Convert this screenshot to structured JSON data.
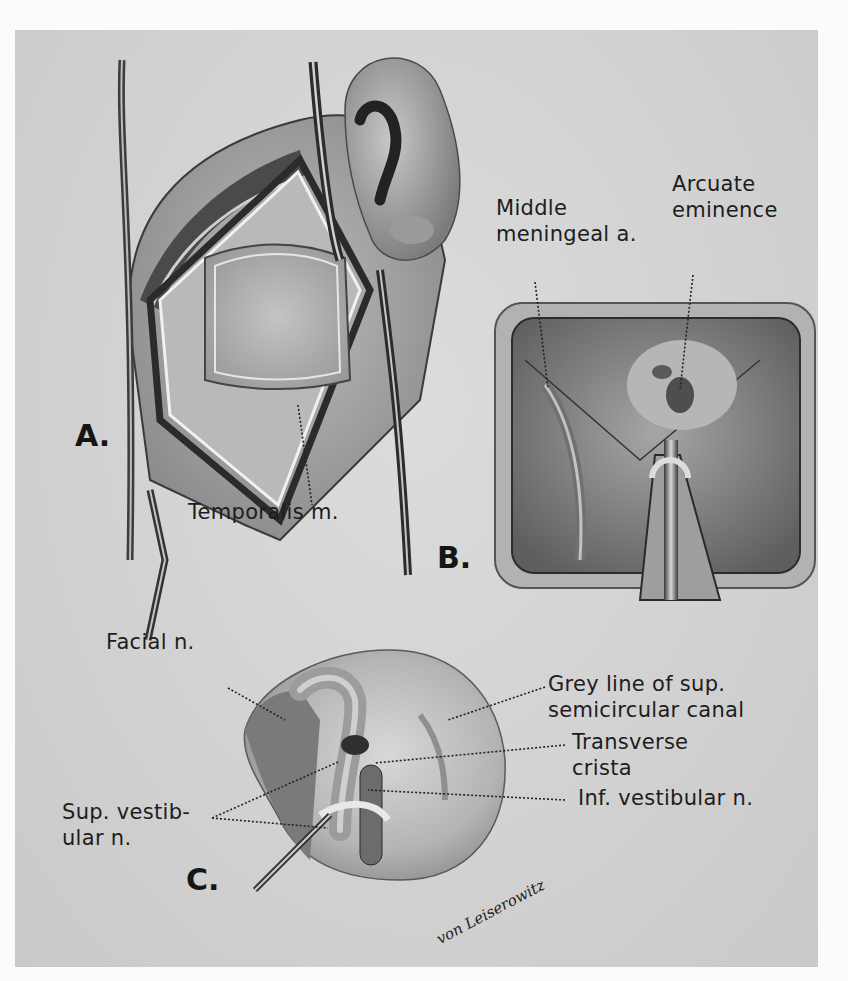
{
  "figure": {
    "type": "surgical anatomy illustration",
    "style": "grayscale",
    "background_color": "#d4d4d4",
    "panels": [
      {
        "id": "A",
        "letter": "A.",
        "labels": [
          "Temporalis m."
        ]
      },
      {
        "id": "B",
        "letter": "B.",
        "labels": [
          "Middle meningeal a.",
          "Arcuate eminence"
        ]
      },
      {
        "id": "C",
        "letter": "C.",
        "labels": [
          "Facial n.",
          "Grey line of sup. semicircular canal",
          "Transverse crista",
          "Sup. vestibular n.",
          "Inf. vestibular n."
        ]
      }
    ]
  },
  "panelA": {
    "letter": "A.",
    "temporalis": "Temporalis m."
  },
  "panelB": {
    "letter": "B.",
    "middle_line1": "Middle",
    "middle_line2": "meningeal a.",
    "arcuate_line1": "Arcuate",
    "arcuate_line2": "eminence"
  },
  "panelC": {
    "letter": "C.",
    "facial": "Facial n.",
    "grey_line1": "Grey line of sup.",
    "grey_line2": "semicircular canal",
    "transverse_line1": "Transverse",
    "transverse_line2": "crista",
    "sup_line1": "Sup. vestib-",
    "sup_line2": "ular n.",
    "inf": "Inf. vestibular n."
  },
  "signature": "von Leiserowitz"
}
